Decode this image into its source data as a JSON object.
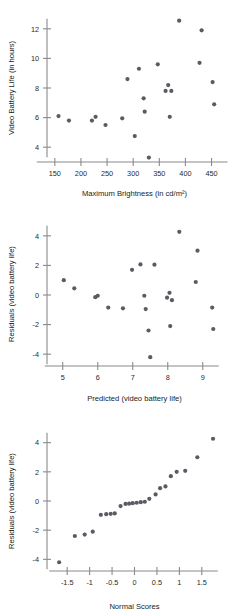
{
  "figure": {
    "panel_count": 3,
    "point_color": "#5b5b66",
    "axis_color": "#8a8a8a",
    "background": "#ffffff"
  },
  "chart_data": [
    {
      "type": "scatter",
      "title": "",
      "xlabel": "Maximum Brightness (in cd/m²)",
      "ylabel": "Video Battery Life (in hours)",
      "xlim": [
        135,
        470
      ],
      "ylim": [
        3.0,
        13.0
      ],
      "xticks": [
        150,
        200,
        250,
        300,
        350,
        400,
        450
      ],
      "xticklabels": [
        "150",
        "200",
        "250",
        "300",
        "350",
        "400",
        "450"
      ],
      "yticks": [
        4,
        6,
        8,
        10,
        12
      ],
      "yticklabels": [
        "4",
        "6",
        "8",
        "10",
        "12"
      ],
      "grid": false,
      "legend": "none",
      "points": [
        {
          "x": 157,
          "y": 6.1
        },
        {
          "x": 177,
          "y": 5.8
        },
        {
          "x": 221,
          "y": 5.8
        },
        {
          "x": 228,
          "y": 6.05
        },
        {
          "x": 247,
          "y": 5.5
        },
        {
          "x": 279,
          "y": 5.95
        },
        {
          "x": 289,
          "y": 8.6
        },
        {
          "x": 303,
          "y": 4.75
        },
        {
          "x": 311,
          "y": 9.3
        },
        {
          "x": 320,
          "y": 7.3
        },
        {
          "x": 322,
          "y": 6.4
        },
        {
          "x": 330,
          "y": 3.3
        },
        {
          "x": 347,
          "y": 9.6
        },
        {
          "x": 362,
          "y": 7.8
        },
        {
          "x": 367,
          "y": 8.2
        },
        {
          "x": 370,
          "y": 6.05
        },
        {
          "x": 373,
          "y": 7.8
        },
        {
          "x": 388,
          "y": 12.55
        },
        {
          "x": 427,
          "y": 9.7
        },
        {
          "x": 431,
          "y": 11.9
        },
        {
          "x": 452,
          "y": 8.4
        },
        {
          "x": 455,
          "y": 6.9
        }
      ]
    },
    {
      "type": "scatter",
      "title": "",
      "xlabel": "Predicted (video battery life)",
      "ylabel": "Residuals (video battery life)",
      "xlim": [
        4.55,
        9.55
      ],
      "ylim": [
        -4.8,
        4.8
      ],
      "xticks": [
        5,
        6,
        7,
        8,
        9
      ],
      "xticklabels": [
        "5",
        "6",
        "7",
        "8",
        "9"
      ],
      "yticks": [
        -4,
        -2,
        0,
        2,
        4
      ],
      "yticklabels": [
        "-4",
        "-2",
        "0",
        "2",
        "4"
      ],
      "grid": false,
      "legend": "none",
      "points": [
        {
          "x": 5.03,
          "y": 1.0
        },
        {
          "x": 5.33,
          "y": 0.45
        },
        {
          "x": 5.93,
          "y": -0.15
        },
        {
          "x": 6.0,
          "y": -0.05
        },
        {
          "x": 6.3,
          "y": -0.85
        },
        {
          "x": 6.72,
          "y": -0.9
        },
        {
          "x": 6.98,
          "y": 1.7
        },
        {
          "x": 7.22,
          "y": 2.07
        },
        {
          "x": 7.33,
          "y": -0.05
        },
        {
          "x": 7.37,
          "y": -0.95
        },
        {
          "x": 7.45,
          "y": -2.4
        },
        {
          "x": 7.5,
          "y": -4.2
        },
        {
          "x": 7.62,
          "y": 2.05
        },
        {
          "x": 7.98,
          "y": -0.18
        },
        {
          "x": 8.05,
          "y": 0.15
        },
        {
          "x": 8.07,
          "y": -2.1
        },
        {
          "x": 8.12,
          "y": -0.35
        },
        {
          "x": 8.33,
          "y": 4.27
        },
        {
          "x": 8.8,
          "y": 0.88
        },
        {
          "x": 8.85,
          "y": 3.0
        },
        {
          "x": 9.27,
          "y": -0.85
        },
        {
          "x": 9.3,
          "y": -2.3
        }
      ]
    },
    {
      "type": "scatter",
      "title": "",
      "xlabel": "Normal Scores",
      "ylabel": "Residuals (video battery life)",
      "xlim": [
        -1.95,
        1.95
      ],
      "ylim": [
        -4.8,
        4.8
      ],
      "xticks": [
        -1.5,
        -1,
        -0.5,
        0,
        0.5,
        1,
        1.5
      ],
      "xticklabels": [
        "-1.5",
        "-1",
        "-0.5",
        "0",
        "0.5",
        "1",
        "1.5"
      ],
      "yticks": [
        -4,
        -2,
        0,
        2,
        4
      ],
      "yticklabels": [
        "-4",
        "-2",
        "0",
        "2",
        "4"
      ],
      "grid": false,
      "legend": "none",
      "points": [
        {
          "x": -1.68,
          "y": -4.2
        },
        {
          "x": -1.33,
          "y": -2.4
        },
        {
          "x": -1.11,
          "y": -2.3
        },
        {
          "x": -0.93,
          "y": -2.1
        },
        {
          "x": -0.75,
          "y": -0.95
        },
        {
          "x": -0.63,
          "y": -0.9
        },
        {
          "x": -0.53,
          "y": -0.88
        },
        {
          "x": -0.44,
          "y": -0.85
        },
        {
          "x": -0.31,
          "y": -0.35
        },
        {
          "x": -0.2,
          "y": -0.2
        },
        {
          "x": -0.12,
          "y": -0.18
        },
        {
          "x": -0.04,
          "y": -0.15
        },
        {
          "x": 0.05,
          "y": -0.12
        },
        {
          "x": 0.14,
          "y": -0.08
        },
        {
          "x": 0.23,
          "y": -0.05
        },
        {
          "x": 0.33,
          "y": 0.15
        },
        {
          "x": 0.47,
          "y": 0.45
        },
        {
          "x": 0.57,
          "y": 0.88
        },
        {
          "x": 0.69,
          "y": 1.0
        },
        {
          "x": 0.81,
          "y": 1.7
        },
        {
          "x": 0.94,
          "y": 2.0
        },
        {
          "x": 1.13,
          "y": 2.07
        },
        {
          "x": 1.4,
          "y": 3.0
        },
        {
          "x": 1.75,
          "y": 4.27
        }
      ]
    }
  ]
}
